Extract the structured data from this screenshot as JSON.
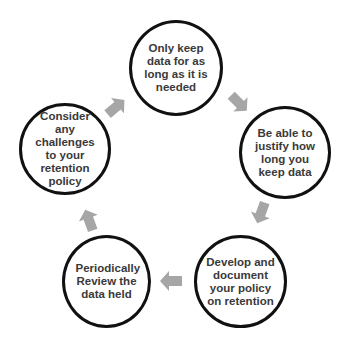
{
  "diagram": {
    "type": "cycle",
    "nodes": [
      {
        "id": "keep",
        "label": "Only keep data for as long as it is needed"
      },
      {
        "id": "justify",
        "label": "Be able to justify how long you keep data"
      },
      {
        "id": "develop",
        "label": "Develop and document your policy on retention"
      },
      {
        "id": "review",
        "label": "Periodically Review the data held"
      },
      {
        "id": "challenges",
        "label": "Consider any challenges to your retention policy"
      }
    ],
    "edges": [
      {
        "from": "keep",
        "to": "justify"
      },
      {
        "from": "justify",
        "to": "develop"
      },
      {
        "from": "develop",
        "to": "review"
      },
      {
        "from": "review",
        "to": "challenges"
      },
      {
        "from": "challenges",
        "to": "keep"
      }
    ],
    "colors": {
      "circle_border": "#111111",
      "arrow": "#a6a6a6",
      "text": "#3a3a3a"
    }
  }
}
